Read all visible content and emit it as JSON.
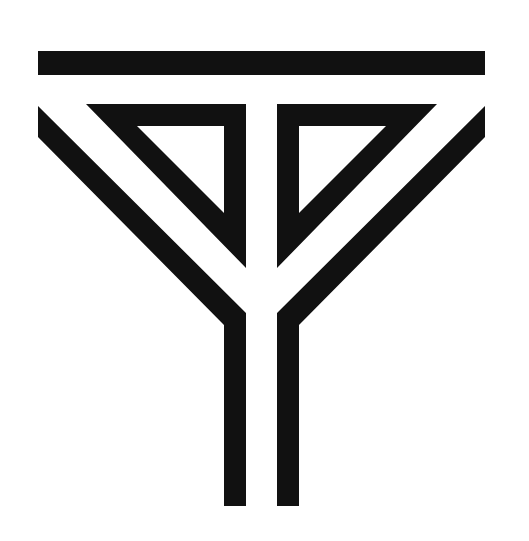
{
  "logo": {
    "description": "Geometric monogram: horizontal bar over two mirrored triangular outlines and diagonal bands converging into two vertical stems",
    "fill_color": "#111111",
    "background_color": "#ffffff"
  }
}
